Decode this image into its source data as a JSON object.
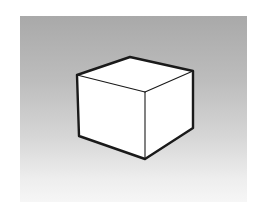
{
  "figure": {
    "background": {
      "top_color": "#a9a9a9",
      "bottom_color": "#f6f6f6"
    },
    "cube": {
      "stroke_color": "#1a1a1a",
      "face_color": "#ffffff",
      "vertices": {
        "top_left": [
          77,
          75
        ],
        "top_back": [
          130,
          57
        ],
        "top_right": [
          193,
          71
        ],
        "front_top": [
          145,
          92
        ],
        "bottom_left": [
          79,
          136
        ],
        "bottom_front": [
          145,
          159
        ],
        "bottom_right": [
          193,
          128
        ]
      }
    }
  }
}
